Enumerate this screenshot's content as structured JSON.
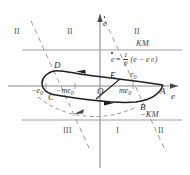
{
  "figure": {
    "axes": {
      "x_label": "e",
      "y_label": "ė",
      "origin_label": "O"
    },
    "colors": {
      "axis": "#8a8a8a",
      "curve": "#1f1f1f",
      "dashed": "#9a9a9a",
      "text": "#333333"
    },
    "region_labels": [
      {
        "id": "II",
        "text": "II",
        "x": 14,
        "y": 30
      },
      {
        "id": "II",
        "text": "II",
        "x": 67,
        "y": 30
      },
      {
        "id": "II",
        "text": "II",
        "x": 134,
        "y": 30
      },
      {
        "id": "III",
        "text": "III",
        "x": 65,
        "y": 130
      },
      {
        "id": "I",
        "text": "I",
        "x": 114,
        "y": 130
      },
      {
        "id": "II",
        "text": "II",
        "x": 158,
        "y": 130
      }
    ],
    "level_lines": [
      {
        "id": "KM",
        "text": "KM",
        "x": 140,
        "y": 39
      },
      {
        "id": "-KM",
        "text": "−KM",
        "x": 144,
        "y": 111
      }
    ],
    "curve_points": [
      {
        "id": "A",
        "text": "A",
        "x": 162,
        "y": 89
      },
      {
        "id": "B",
        "text": "B",
        "x": 141,
        "y": 101
      },
      {
        "id": "C",
        "text": "C",
        "x": 50,
        "y": 91
      },
      {
        "id": "D",
        "text": "D",
        "x": 56,
        "y": 66
      },
      {
        "id": "E",
        "text": "E",
        "x": 112,
        "y": 74
      }
    ],
    "axis_marks": [
      {
        "id": "minus-e0",
        "text": "−e",
        "sub": "0",
        "x": 35,
        "y": 89
      },
      {
        "id": "minus-me0",
        "text": "−me",
        "sub": "0",
        "x": 60,
        "y": 89
      },
      {
        "id": "me0",
        "text": "me",
        "sub": "0",
        "x": 121,
        "y": 89
      },
      {
        "id": "e0",
        "text": "e",
        "sub": "0",
        "x": 131,
        "y": 74
      }
    ],
    "equation": {
      "lhs": "ė",
      "eq_sign": "=",
      "num": "1",
      "den": "β",
      "rhs": "(e − e",
      "rhs_sub": "0",
      "rhs_close": ")",
      "x": 111,
      "y": 55
    }
  }
}
